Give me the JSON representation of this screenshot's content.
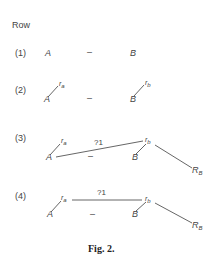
{
  "header": {
    "label": "Row"
  },
  "rows": [
    {
      "label": "(1)",
      "left": "A",
      "dash": "–",
      "right": "B"
    },
    {
      "label": "(2)",
      "left": "A",
      "left_r": "r",
      "left_r_sub": "a",
      "dash": "–",
      "right": "B",
      "right_r": "r",
      "right_r_sub": "b"
    },
    {
      "label": "(3)",
      "left": "A",
      "left_r": "r",
      "left_r_sub": "a",
      "link": "?1",
      "dash": "–",
      "right": "B",
      "right_r": "r",
      "right_r_sub": "b",
      "end": "R",
      "end_sub": "B"
    },
    {
      "label": "(4)",
      "left": "A",
      "left_r": "r",
      "left_r_sub": "a",
      "link": "?1",
      "dash": "–",
      "right": "B",
      "right_r": "r",
      "right_r_sub": "b",
      "end": "R",
      "end_sub": "B"
    }
  ],
  "caption": "Fig. 2.",
  "colors": {
    "stroke": "#555555",
    "text": "#444444"
  }
}
